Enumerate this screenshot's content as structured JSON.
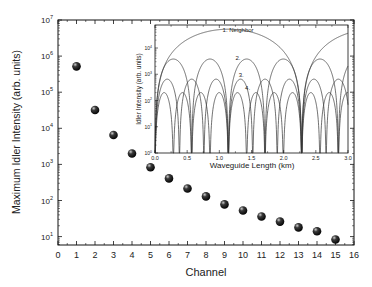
{
  "chart_data": [
    {
      "type": "scatter",
      "title": "",
      "xlabel": "Channel",
      "ylabel": "Maximum Idler Intensity (arb. units)",
      "xlim": [
        0,
        16
      ],
      "ylim": [
        10,
        10000000
      ],
      "yscale": "log",
      "grid": false,
      "legend": null,
      "x_ticks": [
        "0",
        "1",
        "2",
        "3",
        "4",
        "5",
        "6",
        "7",
        "8",
        "9",
        "10",
        "11",
        "12",
        "13",
        "14",
        "15",
        "16"
      ],
      "y_ticks": [
        {
          "base": "10",
          "exp": "1",
          "value": 10
        },
        {
          "base": "10",
          "exp": "2",
          "value": 100
        },
        {
          "base": "10",
          "exp": "3",
          "value": 1000
        },
        {
          "base": "10",
          "exp": "4",
          "value": 10000
        },
        {
          "base": "10",
          "exp": "5",
          "value": 100000
        },
        {
          "base": "10",
          "exp": "6",
          "value": 1000000
        },
        {
          "base": "10",
          "exp": "7",
          "value": 10000000
        }
      ],
      "series": [
        {
          "name": "Maximum idler intensity",
          "marker": "sphere",
          "color": "#111111",
          "x": [
            1,
            2,
            3,
            4,
            5,
            6,
            7,
            8,
            9,
            10,
            11,
            12,
            13,
            14,
            15
          ],
          "values": [
            520000,
            32000,
            6500,
            2000,
            830,
            410,
            215,
            130,
            78,
            53,
            36,
            26,
            18,
            14,
            8.3
          ]
        }
      ]
    },
    {
      "type": "line",
      "title": "",
      "position": "inset",
      "xlabel": "Waveguide Length (km)",
      "ylabel": "Idler Intensity (arb. units)",
      "xlim": [
        0,
        3
      ],
      "ylim": [
        1,
        100000
      ],
      "yscale": "log",
      "grid": false,
      "x_ticks": [
        "0.0",
        "0.5",
        "1.0",
        "1.5",
        "2.0",
        "2.5",
        "3.0"
      ],
      "y_ticks": [
        {
          "base": "10",
          "exp": "0",
          "value": 1
        },
        {
          "base": "10",
          "exp": "1",
          "value": 10
        },
        {
          "base": "10",
          "exp": "2",
          "value": 100
        },
        {
          "base": "10",
          "exp": "3",
          "value": 1000
        },
        {
          "base": "10",
          "exp": "4",
          "value": 10000
        }
      ],
      "annotations": [
        {
          "text": "1. Neighbor",
          "x": 1.05,
          "y": 40000
        },
        {
          "text": "2.",
          "x": 1.25,
          "y": 3500
        },
        {
          "text": "3.",
          "x": 1.3,
          "y": 800
        },
        {
          "text": "4.",
          "x": 1.4,
          "y": 260
        }
      ],
      "series": [
        {
          "name": "1. Neighbor",
          "peak": 52000,
          "period_km": 2.28,
          "color": "#333333"
        },
        {
          "name": "2.",
          "peak": 3800,
          "period_km": 0.57,
          "color": "#333333"
        },
        {
          "name": "3.",
          "peak": 650,
          "period_km": 0.38,
          "color": "#333333"
        },
        {
          "name": "4.",
          "peak": 200,
          "period_km": 0.285,
          "color": "#333333"
        }
      ]
    }
  ]
}
